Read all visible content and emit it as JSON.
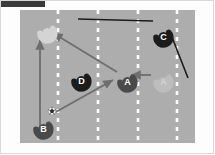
{
  "figure": {
    "kind": "soccer-drill-diagram",
    "caption_bar_color": "#3a3a3a",
    "pitch_color": "#adadad",
    "lane_line_color": "#ffffff",
    "background_color": "#ffffff"
  },
  "pitch": {
    "lane_lines_x": [
      38,
      78,
      118,
      157
    ],
    "lane_line_style": "dashed"
  },
  "players": [
    {
      "id": "b-top",
      "label": "B",
      "team": "B",
      "state": "faded",
      "color": "#d4d4d4",
      "x": 20,
      "y": 16,
      "facing": "right"
    },
    {
      "id": "c-top-right",
      "label": "C",
      "team": "C",
      "state": "solid",
      "color": "#1c1c1c",
      "x": 136,
      "y": 20,
      "facing": "right"
    },
    {
      "id": "d-mid-left",
      "label": "D",
      "team": "D",
      "state": "solid",
      "color": "#1c1c1c",
      "x": 54,
      "y": 64,
      "facing": "right"
    },
    {
      "id": "a-mid",
      "label": "A",
      "team": "A",
      "state": "solid",
      "color": "#4a4a4a",
      "x": 100,
      "y": 65,
      "facing": "right"
    },
    {
      "id": "a-mid-right",
      "label": "A",
      "team": "A",
      "state": "faded",
      "color": "#bdbdbd",
      "x": 136,
      "y": 65,
      "facing": "right"
    },
    {
      "id": "b-bottom-left",
      "label": "B",
      "team": "B",
      "state": "solid",
      "color": "#4a4a4a",
      "x": 16,
      "y": 112,
      "facing": "right"
    }
  ],
  "ball": {
    "id": "ball",
    "name": "soccer-ball",
    "x": 32,
    "y": 101,
    "radius": 4
  },
  "arrows": [
    {
      "id": "run-b-up",
      "name": "run-arrow-b-vertical",
      "kind": "run",
      "color": "#6e6e6e",
      "from": [
        20,
        118
      ],
      "to": [
        20,
        30
      ]
    },
    {
      "id": "pass-a-to-b",
      "name": "pass-arrow-a-to-b-top",
      "kind": "pass",
      "color": "#6e6e6e",
      "from": [
        97,
        62
      ],
      "to": [
        33,
        23
      ]
    },
    {
      "id": "pass-ball-to-a",
      "name": "pass-arrow-ball-to-a",
      "kind": "pass",
      "color": "#6e6e6e",
      "from": [
        34,
        103
      ],
      "to": [
        93,
        70
      ]
    },
    {
      "id": "run-a-right-to-a",
      "name": "run-arrow-a-right-to-a-mid",
      "kind": "run",
      "color": "#6e6e6e",
      "from": [
        131,
        65
      ],
      "to": [
        111,
        65
      ]
    }
  ],
  "marker_lines": [
    {
      "id": "line-top-horizontal",
      "name": "coach-line-horizontal",
      "color": "#1c1c1c",
      "from": [
        58,
        9
      ],
      "to": [
        133,
        11
      ]
    },
    {
      "id": "line-diagonal-right",
      "name": "coach-line-diagonal",
      "color": "#1c1c1c",
      "from": [
        150,
        22
      ],
      "to": [
        168,
        68
      ]
    }
  ]
}
